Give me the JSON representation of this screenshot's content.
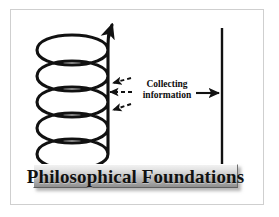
{
  "figure": {
    "type": "process-diagram",
    "background_color": "#ffffff",
    "frame_border_color": "#cfcfcf",
    "ink_color": "#111111"
  },
  "spiral": {
    "name": "ascending-spiral-coil",
    "coil_count": 5,
    "direction": "upward",
    "has_arrowhead": true,
    "arrow_position": "top",
    "stroke_color": "#111111"
  },
  "annotation": {
    "line1": "Collecting",
    "line2": "information"
  },
  "arrows": {
    "dashed_inward_count": 3,
    "dashed_label": "dashed-arrows-to-spiral",
    "solid_right_label": "solid-arrow-to-axis",
    "dash_pattern": "4 3"
  },
  "axis": {
    "name": "vertical-axis-line",
    "orientation": "vertical",
    "color": "#111111"
  },
  "label": {
    "text": "Philosophical Foundations",
    "box_gradient_top": "#f2f2f2",
    "box_gradient_bottom": "#8f8f8f",
    "text_color": "#111111"
  }
}
